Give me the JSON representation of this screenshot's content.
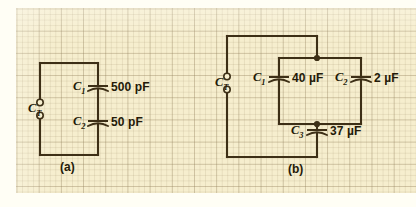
{
  "figure": {
    "type": "circuit-diagram",
    "background": "#f6eece",
    "ink_color": "#3d2f16",
    "panels": [
      {
        "id": "a",
        "caption": "(a)",
        "terminal_label": "C",
        "terminal_sub": "T",
        "topology": "series",
        "components": [
          {
            "name": "C",
            "sub": "1",
            "value": "500 pF"
          },
          {
            "name": "C",
            "sub": "2",
            "value": "50 pF"
          }
        ]
      },
      {
        "id": "b",
        "caption": "(b)",
        "terminal_label": "C",
        "terminal_sub": "T",
        "topology": "two-in-parallel-in-series-with-third",
        "components": [
          {
            "name": "C",
            "sub": "1",
            "value": "40 µF"
          },
          {
            "name": "C",
            "sub": "2",
            "value": "2 µF"
          },
          {
            "name": "C",
            "sub": "3",
            "value": "37 µF"
          }
        ]
      }
    ]
  }
}
